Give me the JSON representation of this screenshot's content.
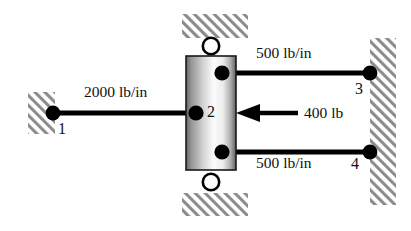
{
  "figure": {
    "type": "spring-mass-system-diagram",
    "background_color": "#ffffff",
    "line_color": "#000000",
    "hatch_color": "#8c8c8c"
  },
  "block": {
    "name": "sliding-block",
    "node_label": "2",
    "x": 186,
    "y": 56,
    "width": 50,
    "height": 114,
    "fill_edge_color": "#6e6e6e",
    "fill_center_color": "#fbfbfb"
  },
  "supports": [
    {
      "name": "left-wall",
      "x": 28,
      "y": 92,
      "width": 27,
      "height": 42
    },
    {
      "name": "top-guide",
      "x": 182,
      "y": 14,
      "width": 66,
      "height": 24
    },
    {
      "name": "bottom-guide",
      "x": 182,
      "y": 193,
      "width": 66,
      "height": 23
    },
    {
      "name": "right-wall",
      "x": 370,
      "y": 38,
      "width": 26,
      "height": 167
    }
  ],
  "rollers": [
    {
      "name": "top-roller",
      "cx": 211,
      "cy": 46,
      "r": 8
    },
    {
      "name": "bottom-roller",
      "cx": 211,
      "cy": 182,
      "r": 8
    }
  ],
  "springs": [
    {
      "name": "spring-1-2",
      "label": "2000 lb/in",
      "stiffness": 2000,
      "units": "lb/in",
      "x1": 53,
      "y1": 113,
      "x2": 196,
      "y2": 113,
      "label_x": 84,
      "label_y": 97
    },
    {
      "name": "spring-2-3",
      "label": "500 lb/in",
      "stiffness": 500,
      "units": "lb/in",
      "x1": 222,
      "y1": 73,
      "x2": 370,
      "y2": 73,
      "label_x": 256,
      "label_y": 57
    },
    {
      "name": "spring-2-4",
      "label": "500 lb/in",
      "stiffness": 500,
      "units": "lb/in",
      "x1": 222,
      "y1": 152,
      "x2": 370,
      "y2": 152,
      "label_x": 256,
      "label_y": 161
    }
  ],
  "nodes": [
    {
      "name": "node-1",
      "label": "1",
      "cx": 53,
      "cy": 113,
      "label_x": 58,
      "label_y": 121
    },
    {
      "name": "node-2",
      "label": "2",
      "cx": 196,
      "cy": 113,
      "label_x": 207,
      "label_y": 104
    },
    {
      "name": "node-3",
      "label": "3",
      "cx": 370,
      "cy": 73,
      "label_x": 355,
      "label_y": 81
    },
    {
      "name": "node-4",
      "label": "4",
      "cx": 370,
      "cy": 152,
      "label_x": 351,
      "label_y": 156
    }
  ],
  "load": {
    "name": "applied-force",
    "label": "400 lb",
    "magnitude": 400,
    "units": "lb",
    "direction": "left",
    "tail_x": 298,
    "tail_y": 113,
    "head_x": 236,
    "head_y": 113,
    "label_x": 304,
    "label_y": 104
  }
}
